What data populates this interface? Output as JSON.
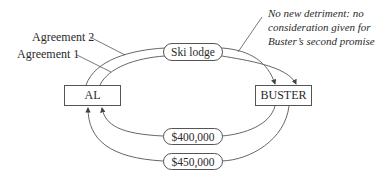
{
  "diagram": {
    "nodes": {
      "al": "AL",
      "buster": "BUSTER"
    },
    "flows": {
      "ski_lodge": "Ski lodge",
      "payment_1": "$400,000",
      "payment_2": "$450,000"
    },
    "labels": {
      "agreement_2": "Agreement 2",
      "agreement_1": "Agreement 1"
    },
    "annotation": {
      "line1": "No new detriment: no",
      "line2": "consideration given for",
      "line3": "Buster’s second promise"
    }
  }
}
